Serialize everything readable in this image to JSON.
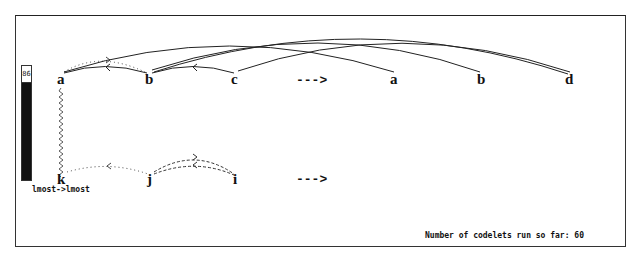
{
  "workspace": {
    "temperature": {
      "label": "86",
      "value": 86
    },
    "initial_string": {
      "letters": [
        "a",
        "b",
        "c"
      ]
    },
    "modified_string": {
      "letters": [
        "a",
        "b",
        "d"
      ]
    },
    "target_string": {
      "letters": [
        "k",
        "j",
        "i"
      ]
    },
    "transform_arrows": {
      "top": "--->",
      "bottom": "--->"
    },
    "correspondence_rule": "lmost->lmost",
    "status": {
      "codelets_text": "Number of codelets run so far: 60",
      "codelets_count": 60
    },
    "colors": {
      "ink": "#111111",
      "frame": "#333333",
      "background": "#ffffff"
    }
  }
}
